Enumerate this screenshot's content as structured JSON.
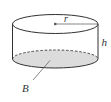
{
  "diagram": {
    "type": "cylinder",
    "labels": {
      "radius": "r",
      "height": "h",
      "base": "B"
    },
    "colors": {
      "stroke": "#333333",
      "base_fill": "#dcdcdc",
      "background": "#ffffff"
    }
  }
}
